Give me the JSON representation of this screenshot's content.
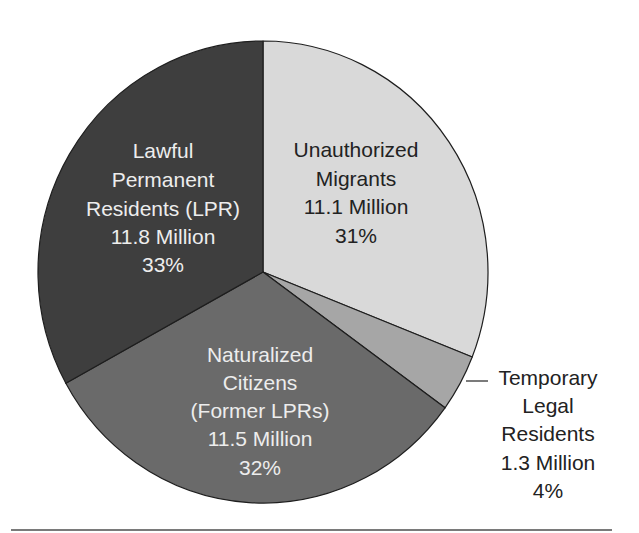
{
  "chart_data": {
    "type": "pie",
    "title": "",
    "units": "Million",
    "start_angle_deg": 0,
    "direction": "clockwise",
    "slices": [
      {
        "key": "unauthorized",
        "label_lines": [
          "Unauthorized",
          "Migrants"
        ],
        "value": 11.1,
        "value_text": "11.1 Million",
        "percent": 31,
        "percent_text": "31%",
        "color": "#d9d9d9",
        "text_color": "#222222"
      },
      {
        "key": "temporary",
        "label_lines": [
          "Temporary",
          "Legal",
          "Residents"
        ],
        "value": 1.3,
        "value_text": "1.3 Million",
        "percent": 4,
        "percent_text": "4%",
        "color": "#a6a6a6",
        "text_color": "#222222",
        "external_label": true
      },
      {
        "key": "naturalized",
        "label_lines": [
          "Naturalized",
          "Citizens",
          "(Former LPRs)"
        ],
        "value": 11.5,
        "value_text": "11.5 Million",
        "percent": 32,
        "percent_text": "32%",
        "color": "#6a6a6a",
        "text_color": "#ededed"
      },
      {
        "key": "lpr",
        "label_lines": [
          "Lawful",
          "Permanent",
          "Residents (LPR)"
        ],
        "value": 11.8,
        "value_text": "11.8 Million",
        "percent": 33,
        "percent_text": "33%",
        "color": "#3e3e3e",
        "text_color": "#ededed"
      }
    ],
    "legend": "none (direct labels)"
  },
  "labels": {
    "unauthorized": {
      "l1": "Unauthorized",
      "l2": "Migrants",
      "value": "11.1 Million",
      "pct": "31%"
    },
    "temporary": {
      "l1": "Temporary",
      "l2": "Legal",
      "l3": "Residents",
      "value": "1.3 Million",
      "pct": "4%"
    },
    "naturalized": {
      "l1": "Naturalized",
      "l2": "Citizens",
      "l3": "(Former LPRs)",
      "value": "11.5 Million",
      "pct": "32%"
    },
    "lpr": {
      "l1": "Lawful",
      "l2": "Permanent",
      "l3": "Residents (LPR)",
      "value": "11.8 Million",
      "pct": "33%"
    }
  },
  "geometry": {
    "cx": 263,
    "cy": 272,
    "rx": 225,
    "ry": 231
  }
}
